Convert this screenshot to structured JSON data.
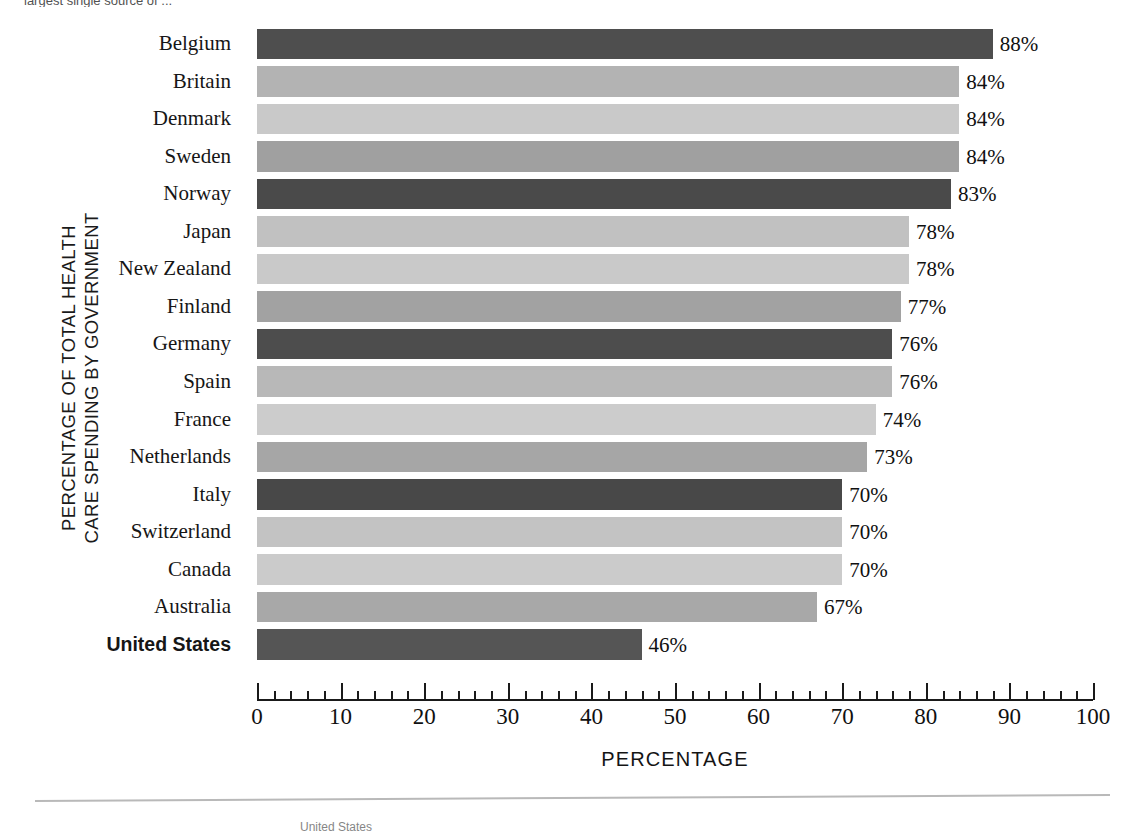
{
  "top_caption": "largest single source of ...",
  "footer_caption": "United States",
  "chart_data": {
    "type": "bar",
    "orientation": "horizontal",
    "title": "",
    "subtitle": "",
    "xlabel": "PERCENTAGE",
    "ylabel": "PERCENTAGE OF TOTAL HEALTH CARE SPENDING BY GOVERNMENT",
    "ylabel_lines": [
      "PERCENTAGE OF TOTAL HEALTH",
      "CARE SPENDING BY GOVERNMENT"
    ],
    "xlim": [
      0,
      100
    ],
    "xticks": [
      0,
      10,
      20,
      30,
      40,
      50,
      60,
      70,
      80,
      90,
      100
    ],
    "xtick_labels": [
      "0",
      "10",
      "20",
      "30",
      "40",
      "50",
      "60",
      "70",
      "80",
      "90",
      "100"
    ],
    "minor_tick_step": 2,
    "grid": false,
    "legend": "none",
    "categories": [
      "Belgium",
      "Britain",
      "Denmark",
      "Sweden",
      "Norway",
      "Japan",
      "New Zealand",
      "Finland",
      "Germany",
      "Spain",
      "France",
      "Netherlands",
      "Italy",
      "Switzerland",
      "Canada",
      "Australia",
      "United States"
    ],
    "values": [
      88,
      84,
      84,
      84,
      83,
      78,
      78,
      77,
      76,
      76,
      74,
      73,
      70,
      70,
      70,
      67,
      46
    ],
    "value_labels": [
      "88%",
      "84%",
      "84%",
      "84%",
      "83%",
      "78%",
      "78%",
      "77%",
      "76%",
      "76%",
      "74%",
      "73%",
      "70%",
      "70%",
      "70%",
      "67%",
      "46%"
    ],
    "bar_colors": [
      "#4e4e4e",
      "#b3b3b3",
      "#c9c9c9",
      "#a0a0a0",
      "#4a4a4a",
      "#c1c1c1",
      "#c9c9c9",
      "#a2a2a2",
      "#4d4d4d",
      "#b8b8b8",
      "#cccccc",
      "#a6a6a6",
      "#484848",
      "#c3c3c3",
      "#cbcbcb",
      "#a8a8a8",
      "#555555"
    ],
    "highlight_category": "United States",
    "accent_dark": "#4a4a4a",
    "accent_light": "#c9c9c9"
  }
}
